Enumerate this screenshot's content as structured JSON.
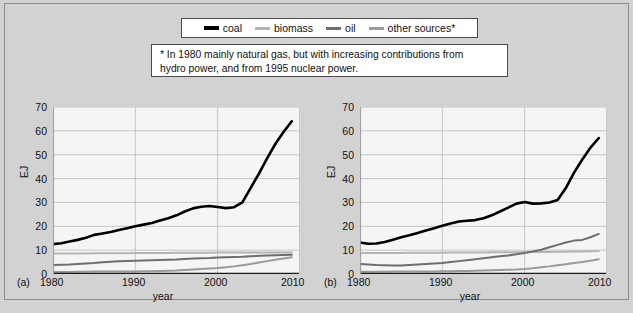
{
  "legend": {
    "entries": [
      {
        "label": "coal",
        "color": "#000000"
      },
      {
        "label": "biomass",
        "color": "#b4b4b4"
      },
      {
        "label": "oil",
        "color": "#6e6e6e"
      },
      {
        "label": "other sources*",
        "color": "#9a9a9a"
      }
    ]
  },
  "footnote": {
    "line1": "* In 1980 mainly natural gas, but with increasing contributions from",
    "line2": "hydro power, and from 1995 nuclear power."
  },
  "panels": {
    "a": {
      "tag": "(a)"
    },
    "b": {
      "tag": "(b)"
    }
  },
  "axes": {
    "ylabel": "EJ",
    "xlabel": "year",
    "yticks": [
      "0",
      "10",
      "20",
      "30",
      "40",
      "50",
      "60",
      "70"
    ],
    "xticks": [
      "1980",
      "1990",
      "2000",
      "2010"
    ],
    "ylim": [
      0,
      70
    ],
    "xlim": [
      1980,
      2010
    ]
  },
  "chart_data": [
    {
      "type": "line",
      "title": "(a)",
      "xlabel": "year",
      "ylabel": "EJ",
      "xlim": [
        1980,
        2010
      ],
      "ylim": [
        0,
        70
      ],
      "grid": true,
      "legend_position": "top-outside",
      "x": [
        1980,
        1981,
        1982,
        1983,
        1984,
        1985,
        1986,
        1987,
        1988,
        1989,
        1990,
        1991,
        1992,
        1993,
        1994,
        1995,
        1996,
        1997,
        1998,
        1999,
        2000,
        2001,
        2002,
        2003,
        2004,
        2005,
        2006,
        2007,
        2008,
        2009
      ],
      "series": [
        {
          "name": "coal",
          "color": "#000000",
          "values": [
            12.5,
            12.9,
            13.6,
            14.3,
            15.2,
            16.4,
            17.0,
            17.6,
            18.4,
            19.2,
            20.0,
            20.7,
            21.4,
            22.4,
            23.4,
            24.6,
            26.2,
            27.5,
            28.2,
            28.5,
            28.1,
            27.6,
            28.0,
            30.0,
            36.0,
            42.0,
            48.5,
            54.5,
            59.5,
            64.0
          ]
        },
        {
          "name": "biomass",
          "color": "#b4b4b4",
          "values": [
            8.6,
            8.6,
            8.6,
            8.6,
            8.6,
            8.7,
            8.7,
            8.7,
            8.7,
            8.7,
            8.8,
            8.8,
            8.8,
            8.8,
            8.8,
            8.9,
            8.9,
            8.9,
            8.9,
            8.9,
            9.0,
            9.0,
            9.0,
            9.0,
            9.0,
            9.0,
            9.0,
            9.0,
            9.0,
            9.0
          ]
        },
        {
          "name": "oil",
          "color": "#6e6e6e",
          "values": [
            3.8,
            3.9,
            4.0,
            4.2,
            4.4,
            4.6,
            4.9,
            5.1,
            5.3,
            5.5,
            5.6,
            5.7,
            5.8,
            5.9,
            6.0,
            6.1,
            6.3,
            6.5,
            6.6,
            6.7,
            6.9,
            7.0,
            7.1,
            7.2,
            7.4,
            7.6,
            7.8,
            7.9,
            8.0,
            8.1
          ]
        },
        {
          "name": "other sources",
          "color": "#9a9a9a",
          "values": [
            0.8,
            0.8,
            0.8,
            0.9,
            0.9,
            1.0,
            1.0,
            1.0,
            1.1,
            1.1,
            1.1,
            1.2,
            1.2,
            1.3,
            1.4,
            1.5,
            1.7,
            1.9,
            2.1,
            2.3,
            2.5,
            2.8,
            3.2,
            3.7,
            4.2,
            4.8,
            5.4,
            6.0,
            6.5,
            7.0
          ]
        }
      ]
    },
    {
      "type": "line",
      "title": "(b)",
      "xlabel": "year",
      "ylabel": "EJ",
      "xlim": [
        1980,
        2010
      ],
      "ylim": [
        0,
        70
      ],
      "grid": true,
      "legend_position": "top-outside",
      "x": [
        1980,
        1981,
        1982,
        1983,
        1984,
        1985,
        1986,
        1987,
        1988,
        1989,
        1990,
        1991,
        1992,
        1993,
        1994,
        1995,
        1996,
        1997,
        1998,
        1999,
        2000,
        2001,
        2002,
        2003,
        2004,
        2005,
        2006,
        2007,
        2008,
        2009
      ],
      "series": [
        {
          "name": "coal",
          "color": "#000000",
          "values": [
            13.2,
            12.7,
            12.8,
            13.4,
            14.4,
            15.4,
            16.2,
            17.2,
            18.2,
            19.2,
            20.2,
            21.2,
            22.0,
            22.3,
            22.6,
            23.4,
            24.6,
            26.2,
            27.8,
            29.5,
            30.2,
            29.5,
            29.6,
            30.0,
            31.0,
            36.0,
            42.5,
            48.0,
            53.0,
            57.0
          ]
        },
        {
          "name": "biomass",
          "color": "#b4b4b4",
          "values": [
            8.8,
            8.8,
            8.8,
            8.8,
            8.8,
            8.8,
            8.9,
            8.9,
            8.9,
            8.9,
            8.9,
            9.0,
            9.0,
            9.0,
            9.0,
            9.0,
            9.1,
            9.1,
            9.1,
            9.1,
            9.2,
            9.2,
            9.2,
            9.2,
            9.3,
            9.3,
            9.4,
            9.4,
            9.5,
            9.6
          ]
        },
        {
          "name": "oil",
          "color": "#6e6e6e",
          "values": [
            4.2,
            4.0,
            3.8,
            3.7,
            3.6,
            3.6,
            3.8,
            4.0,
            4.2,
            4.4,
            4.6,
            5.0,
            5.4,
            5.8,
            6.2,
            6.6,
            7.0,
            7.4,
            7.8,
            8.3,
            8.8,
            9.4,
            10.2,
            11.2,
            12.2,
            13.2,
            14.0,
            14.3,
            15.4,
            16.8
          ]
        },
        {
          "name": "other sources",
          "color": "#9a9a9a",
          "values": [
            0.9,
            0.9,
            0.9,
            0.9,
            1.0,
            1.0,
            1.0,
            1.1,
            1.1,
            1.1,
            1.2,
            1.2,
            1.3,
            1.3,
            1.4,
            1.5,
            1.6,
            1.7,
            1.8,
            1.9,
            2.1,
            2.4,
            2.8,
            3.2,
            3.7,
            4.1,
            4.6,
            5.0,
            5.6,
            6.2
          ]
        }
      ]
    }
  ]
}
